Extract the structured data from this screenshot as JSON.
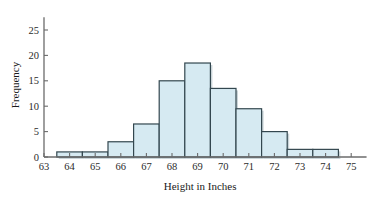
{
  "chart_data": {
    "type": "bar",
    "title": "",
    "subtitle": "",
    "xlabel": "Height in Inches",
    "ylabel": "Frequency",
    "categories": [
      64,
      65,
      66,
      67,
      68,
      69,
      70,
      71,
      72,
      73,
      74
    ],
    "values": [
      1,
      1,
      3,
      6.5,
      15,
      18.5,
      13.5,
      9.5,
      5,
      1.5,
      1.5
    ],
    "bin_edges": [
      63.5,
      64.5,
      65.5,
      66.5,
      67.5,
      68.5,
      69.5,
      70.5,
      71.5,
      72.5,
      73.5,
      74.5
    ],
    "xlim": [
      63,
      75.6
    ],
    "ylim": [
      0,
      27.5
    ],
    "x_ticks": [
      63,
      64,
      65,
      66,
      67,
      68,
      69,
      70,
      71,
      72,
      73,
      74,
      75
    ],
    "x_tick_labels": [
      "63",
      "64",
      "65",
      "66",
      "67",
      "68",
      "69",
      "70",
      "71",
      "72",
      "73",
      "74",
      "75"
    ],
    "y_ticks": [
      0,
      5,
      10,
      15,
      20,
      25
    ],
    "y_tick_labels": [
      "0",
      "5",
      "10",
      "15",
      "20",
      "25"
    ],
    "grid": false,
    "legend": false,
    "legend_position": "none",
    "bar_fill_color": "#d6eaf2",
    "bar_edge_color": "#33474f",
    "axis_color": "#6b6b6b",
    "background_color": "#ffffff"
  }
}
